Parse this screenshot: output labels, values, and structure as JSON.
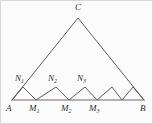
{
  "figure": {
    "canvas": {
      "width": 153,
      "height": 124
    },
    "colors": {
      "background": "#fbfbfb",
      "stroke": "#4a4a4a",
      "baseline_stroke": "#6a6a6a",
      "label_text": "#2b2b2b",
      "border": "#d8d8d8"
    },
    "stroke_width": 0.9,
    "points": {
      "A": {
        "x": 11,
        "y": 99,
        "label": "A",
        "sub": ""
      },
      "B": {
        "x": 143,
        "y": 99,
        "label": "B",
        "sub": ""
      },
      "C": {
        "x": 77,
        "y": 17,
        "label": "C",
        "sub": ""
      },
      "N1": {
        "x": 22,
        "y": 86,
        "label": "N",
        "sub": "1"
      },
      "N2": {
        "x": 55,
        "y": 86,
        "label": "N",
        "sub": "2"
      },
      "N3": {
        "x": 84,
        "y": 86,
        "label": "N",
        "sub": "3"
      },
      "N4": {
        "x": 111,
        "y": 86,
        "label": "",
        "sub": ""
      },
      "N5": {
        "x": 132,
        "y": 86,
        "label": "",
        "sub": ""
      },
      "M1": {
        "x": 35,
        "y": 99,
        "label": "M",
        "sub": "1"
      },
      "M2": {
        "x": 68,
        "y": 99,
        "label": "M",
        "sub": "2"
      },
      "M3": {
        "x": 96,
        "y": 99,
        "label": "M",
        "sub": "3"
      },
      "M4": {
        "x": 121,
        "y": 99,
        "label": "",
        "sub": ""
      }
    },
    "paths": {
      "triangle": "M 11 99 L 77 17 L 143 99",
      "baseline": "M 11 99 L 143 99",
      "zigzag": "M 11 99 L 22 86 L 35 99 L 55 86 L 68 99 L 84 86 L 96 99 L 111 86 L 121 99 L 132 86 L 143 99"
    },
    "labels": [
      {
        "name": "label-C",
        "text": "C",
        "sub": "",
        "x": 74,
        "y": 2
      },
      {
        "name": "label-N1",
        "text": "N",
        "sub": "1",
        "x": 14,
        "y": 73
      },
      {
        "name": "label-N2",
        "text": "N",
        "sub": "2",
        "x": 47,
        "y": 73
      },
      {
        "name": "label-N3",
        "text": "N",
        "sub": "3",
        "x": 76,
        "y": 73
      },
      {
        "name": "label-A",
        "text": "A",
        "sub": "",
        "x": 5,
        "y": 103
      },
      {
        "name": "label-M1",
        "text": "M",
        "sub": "1",
        "x": 28,
        "y": 103
      },
      {
        "name": "label-M2",
        "text": "M",
        "sub": "2",
        "x": 60,
        "y": 103
      },
      {
        "name": "label-M3",
        "text": "M",
        "sub": "3",
        "x": 88,
        "y": 103
      },
      {
        "name": "label-B",
        "text": "B",
        "sub": "",
        "x": 139,
        "y": 103
      }
    ]
  }
}
